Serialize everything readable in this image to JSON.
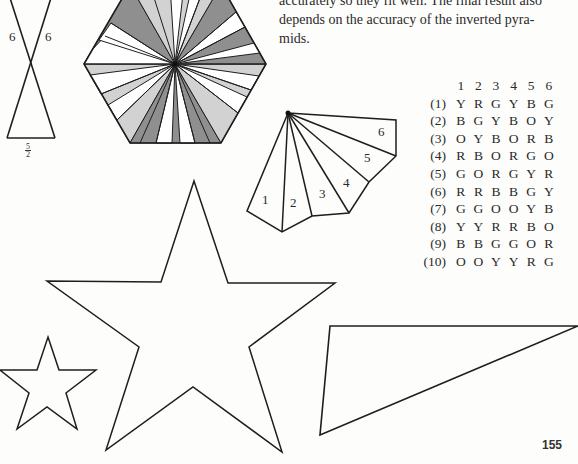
{
  "paragraph": {
    "lines": [
      "accurately so they fit well. The final result also",
      "depends on the accuracy of the inverted pyra-",
      "mids."
    ]
  },
  "color_table": {
    "column_headers": [
      "1",
      "2",
      "3",
      "4",
      "5",
      "6"
    ],
    "rows": [
      {
        "label": "(1)",
        "cells": [
          "Y",
          "R",
          "G",
          "Y",
          "B",
          "G"
        ]
      },
      {
        "label": "(2)",
        "cells": [
          "B",
          "G",
          "Y",
          "B",
          "O",
          "Y"
        ]
      },
      {
        "label": "(3)",
        "cells": [
          "O",
          "Y",
          "B",
          "O",
          "R",
          "B"
        ]
      },
      {
        "label": "(4)",
        "cells": [
          "R",
          "B",
          "O",
          "R",
          "G",
          "O"
        ]
      },
      {
        "label": "(5)",
        "cells": [
          "G",
          "O",
          "R",
          "G",
          "Y",
          "R"
        ]
      },
      {
        "label": "(6)",
        "cells": [
          "R",
          "R",
          "B",
          "B",
          "G",
          "Y"
        ]
      },
      {
        "label": "(7)",
        "cells": [
          "G",
          "G",
          "O",
          "O",
          "Y",
          "B"
        ]
      },
      {
        "label": "(8)",
        "cells": [
          "Y",
          "Y",
          "R",
          "R",
          "B",
          "O"
        ]
      },
      {
        "label": "(9)",
        "cells": [
          "B",
          "B",
          "G",
          "G",
          "O",
          "R"
        ]
      },
      {
        "label": "(10)",
        "cells": [
          "O",
          "O",
          "Y",
          "Y",
          "R",
          "G"
        ]
      }
    ]
  },
  "hourglass": {
    "side_label_left": "6",
    "side_label_right": "6",
    "base_label_num": "5",
    "base_label_den": "2"
  },
  "fan": {
    "segment_labels": [
      "1",
      "2",
      "3",
      "4",
      "5",
      "6"
    ]
  },
  "page_number": "155",
  "colors": {
    "line": "#1e1e1e",
    "shade_dark": "#8f8f8f",
    "shade_light": "#d2d2d2",
    "white": "#ffffff"
  }
}
